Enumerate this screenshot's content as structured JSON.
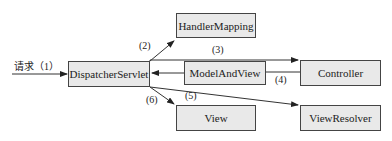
{
  "nodes": {
    "dispatcher": "DispatcherServlet",
    "handler_mapping": "HandlerMapping",
    "model_and_view": "ModelAndView",
    "controller": "Controller",
    "view": "View",
    "view_resolver": "ViewResolver"
  },
  "edges": {
    "request": "请求（1）",
    "step2": "(2)",
    "step3": "(3)",
    "step4": "(4)",
    "step5": "(5)",
    "step6": "(6)"
  },
  "colors": {
    "box_fill": "#e9e9e9",
    "stroke": "#333333"
  }
}
